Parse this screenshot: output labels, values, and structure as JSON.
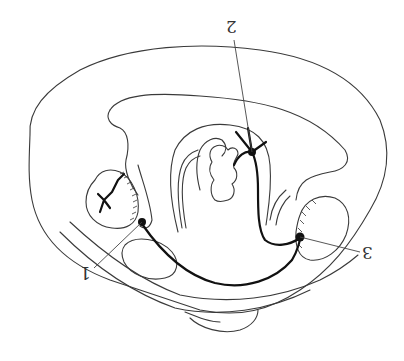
{
  "figure": {
    "orientation": "rotated 180 degrees",
    "labels": [
      {
        "id": "1",
        "text": "1"
      },
      {
        "id": "2",
        "text": "2"
      },
      {
        "id": "3",
        "text": "3"
      }
    ],
    "colors": {
      "line": "#3a3a3a",
      "pathway": "#111111",
      "background": "#ffffff"
    }
  }
}
